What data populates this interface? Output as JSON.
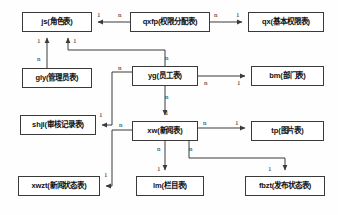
{
  "diagram": {
    "type": "entity-relationship-diagram",
    "colors": {
      "box_border": "#3a3a3a",
      "box_fill": "#ffffff",
      "line": "#3a3a3a",
      "text": "#101010",
      "background": "#fefefe"
    },
    "entities": [
      {
        "id": "js",
        "label": "js(角色表)",
        "x": 22,
        "y": 12,
        "w": 70,
        "h": 20
      },
      {
        "id": "qxfp",
        "label": "qxfp(权限分配表)",
        "x": 130,
        "y": 12,
        "w": 80,
        "h": 20
      },
      {
        "id": "qx",
        "label": "qx(基本权限表)",
        "x": 248,
        "y": 12,
        "w": 76,
        "h": 20
      },
      {
        "id": "gly",
        "label": "gly(管理员表)",
        "x": 22,
        "y": 68,
        "w": 70,
        "h": 20
      },
      {
        "id": "yg",
        "label": "yg(员工表)",
        "x": 132,
        "y": 66,
        "w": 66,
        "h": 20
      },
      {
        "id": "bm",
        "label": "bm(部门表)",
        "x": 251,
        "y": 66,
        "w": 73,
        "h": 20
      },
      {
        "id": "shjl",
        "label": "shjl(审核记录表)",
        "x": 20,
        "y": 115,
        "w": 76,
        "h": 20
      },
      {
        "id": "xw",
        "label": "xw(新闻表)",
        "x": 132,
        "y": 121,
        "w": 66,
        "h": 20
      },
      {
        "id": "tp",
        "label": "tp(图片表)",
        "x": 251,
        "y": 121,
        "w": 73,
        "h": 20
      },
      {
        "id": "xwzt",
        "label": "xwzt(新闻状态表)",
        "x": 18,
        "y": 176,
        "w": 82,
        "h": 20
      },
      {
        "id": "lm",
        "label": "lm(栏目表)",
        "x": 136,
        "y": 176,
        "w": 68,
        "h": 20
      },
      {
        "id": "fbzt",
        "label": "fbzt(发布状态表)",
        "x": 245,
        "y": 176,
        "w": 80,
        "h": 20
      }
    ],
    "relationships": [
      {
        "from": "qxfp",
        "to": "js",
        "from_card": "n",
        "to_card": "1"
      },
      {
        "from": "qxfp",
        "to": "qx",
        "from_card": "n",
        "to_card": "1"
      },
      {
        "from": "gly",
        "to": "js",
        "from_card": "n",
        "to_card": "1"
      },
      {
        "from": "yg",
        "to": "js",
        "from_card": "n",
        "to_card": "1"
      },
      {
        "from": "yg",
        "to": "bm",
        "from_card": "n",
        "to_card": "1"
      },
      {
        "from": "yg",
        "to": "shjl",
        "from_card": "n",
        "to_card": "1"
      },
      {
        "from": "yg",
        "to": "xw",
        "from_card": "n",
        "to_card": "1"
      },
      {
        "from": "xw",
        "to": "tp",
        "from_card": "n",
        "to_card": "1"
      },
      {
        "from": "xw",
        "to": "xwzt",
        "from_card": "n",
        "to_card": "1"
      },
      {
        "from": "xw",
        "to": "lm",
        "from_card": "n",
        "to_card": "1"
      },
      {
        "from": "xw",
        "to": "fbzt",
        "from_card": "n",
        "to_card": "1"
      }
    ],
    "cardinality_labels": [
      {
        "id": "js-from-qxfp",
        "text": "1",
        "x": 97,
        "y": 12
      },
      {
        "id": "qxfp-to-js",
        "text": "n",
        "x": 118,
        "y": 12
      },
      {
        "id": "qxfp-to-qx",
        "text": "n",
        "x": 214,
        "y": 12
      },
      {
        "id": "qx-from-qxfp",
        "text": "1",
        "x": 236,
        "y": 12
      },
      {
        "id": "js-from-gly",
        "text": "1",
        "x": 37,
        "y": 38
      },
      {
        "id": "gly-to-js",
        "text": "n",
        "x": 37,
        "y": 56
      },
      {
        "id": "js-from-yg",
        "text": "1",
        "x": 73,
        "y": 38
      },
      {
        "id": "yg-to-js",
        "text": "n",
        "x": 165,
        "y": 55
      },
      {
        "id": "yg-to-shjl",
        "text": "n",
        "x": 118,
        "y": 65
      },
      {
        "id": "yg-to-bm",
        "text": "n",
        "x": 204,
        "y": 80
      },
      {
        "id": "bm-from-yg",
        "text": "1",
        "x": 237,
        "y": 80
      },
      {
        "id": "yg-to-xw",
        "text": "n",
        "x": 165,
        "y": 94
      },
      {
        "id": "xw-from-yg",
        "text": "1",
        "x": 165,
        "y": 110
      },
      {
        "id": "shjl-from-yg",
        "text": "1",
        "x": 99,
        "y": 112
      },
      {
        "id": "xw-to-xwzt",
        "text": "n",
        "x": 119,
        "y": 122
      },
      {
        "id": "xw-to-tp",
        "text": "n",
        "x": 203,
        "y": 120
      },
      {
        "id": "tp-from-xw",
        "text": "1",
        "x": 235,
        "y": 120
      },
      {
        "id": "xw-to-lm",
        "text": "n",
        "x": 157,
        "y": 146
      },
      {
        "id": "xw-to-fbzt",
        "text": "n",
        "x": 189,
        "y": 146
      },
      {
        "id": "lm-from-xw",
        "text": "1",
        "x": 157,
        "y": 166
      },
      {
        "id": "fbzt-from-xw",
        "text": "1",
        "x": 268,
        "y": 166
      },
      {
        "id": "xwzt-from-xw",
        "text": "1",
        "x": 104,
        "y": 172
      }
    ]
  }
}
